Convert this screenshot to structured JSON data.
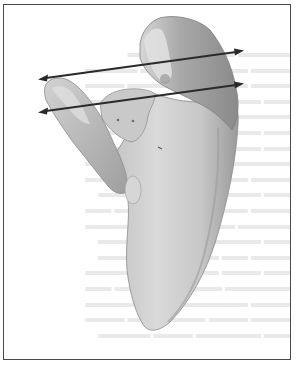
{
  "figure": {
    "border_color": "#4a4a4a",
    "background_color": "#ffffff",
    "bone_colors": {
      "light": "#d8d8d8",
      "mid": "#b9b9b9",
      "dark": "#8f8f8f",
      "outline": "#7a7a7a"
    },
    "arrows": [
      {
        "name": "upper-arrow",
        "x1": 40,
        "y1": 79,
        "x2": 242,
        "y2": 51,
        "color": "#2a2a2a"
      },
      {
        "name": "lower-arrow",
        "x1": 40,
        "y1": 112,
        "x2": 242,
        "y2": 84,
        "color": "#2a2a2a"
      }
    ],
    "bleed_through_text": "faint reversed text from opposite side of page (illegible)"
  }
}
